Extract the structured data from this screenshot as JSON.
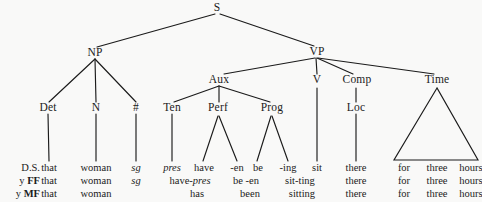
{
  "figure": {
    "kind": "syntactic-derivation-tree",
    "background_color": "#f9f9f8",
    "ink_color": "#1b1b1b"
  },
  "nodes": {
    "s": "S",
    "np": "NP",
    "vp": "VP",
    "det": "Det",
    "n": "N",
    "num": "#",
    "aux": "Aux",
    "ten": "Ten",
    "perf": "Perf",
    "prog": "Prog",
    "v": "V",
    "comp": "Comp",
    "loc": "Loc",
    "time": "Time"
  },
  "row_labels": {
    "deep_structure": "D.S.",
    "by_ff_prefix": "y ",
    "by_ff_bold": "FF",
    "by_mf_prefix": "y ",
    "by_mf_bold": "MF"
  },
  "terminals": {
    "deep_structure": {
      "det": "that",
      "n": "woman",
      "num": "sg",
      "ten": "pres",
      "perf_have": "have",
      "perf_en": "-en",
      "prog_be": "be",
      "prog_ing": "-ing",
      "v": "sit",
      "loc": "there",
      "time_for": "for",
      "time_three": "three",
      "time_hours": "hours"
    },
    "by_ff": {
      "det": "that",
      "n": "woman",
      "num": "sg",
      "have_pres_a": "have-",
      "have_pres_b": "pres",
      "be_en": "be -en",
      "sit_ting": "sit-ting",
      "loc": "there",
      "time_for": "for",
      "time_three": "three",
      "time_hours": "hours"
    },
    "by_mf": {
      "det": "that",
      "n": "woman",
      "has": "has",
      "been": "been",
      "sitting": "sitting",
      "loc": "there",
      "time_for": "for",
      "time_three": "three",
      "time_hours": "hours"
    }
  }
}
